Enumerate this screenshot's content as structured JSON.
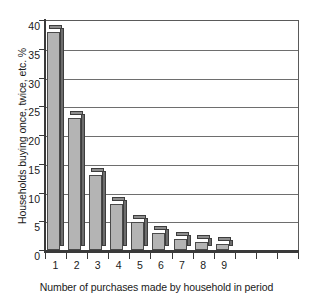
{
  "chart_data": {
    "type": "bar",
    "title": "",
    "subtitle": "",
    "xlabel": "Number of purchases made by household in period",
    "ylabel": "Households buying once, twice, etc. %",
    "categories": [
      "1",
      "2",
      "3",
      "4",
      "5",
      "6",
      "7",
      "8",
      "9",
      "",
      "",
      ""
    ],
    "values": [
      37.9,
      23.0,
      13.0,
      8.0,
      4.9,
      3.0,
      2.0,
      1.4,
      1.0,
      0,
      0,
      0
    ],
    "series": [
      {
        "name": "Households buying once, twice, etc. %",
        "values": [
          37.9,
          23.0,
          13.0,
          8.0,
          4.9,
          3.0,
          2.0,
          1.4,
          1.0,
          0,
          0,
          0
        ]
      }
    ],
    "ylim": [
      0,
      40
    ],
    "ytick_step": 5,
    "yticks": [
      0,
      5,
      10,
      15,
      20,
      25,
      30,
      35,
      40
    ],
    "ytick_labels": [
      "0",
      "5",
      "10",
      "15",
      "20",
      "25",
      "30",
      "35",
      "40"
    ],
    "xtick_labels": [
      "1",
      "2",
      "3",
      "4",
      "5",
      "6",
      "7",
      "8",
      "9"
    ],
    "grid": "horizontal",
    "legend": "none",
    "style": "3d-bar",
    "colors": {
      "bar_front": "#b4b4b4",
      "bar_side": "#6d6d6d",
      "bar_top": "#8d8d8d",
      "bar_outline": "#4a4a4a",
      "gridline": "#6e6e6e",
      "axis": "#3a3a3a",
      "background": "#ffffff",
      "text": "#1a1a1a"
    }
  }
}
